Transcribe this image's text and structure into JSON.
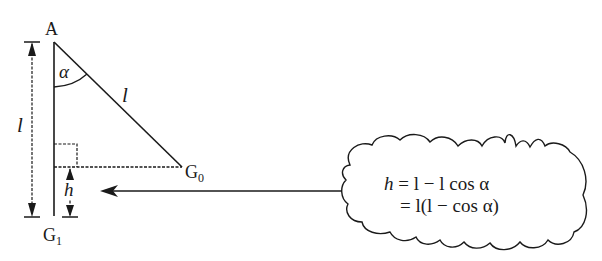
{
  "diagram": {
    "type": "pendulum-geometry",
    "colors": {
      "stroke": "#1a1a1a",
      "background": "#ffffff"
    },
    "labels": {
      "pivot": "A",
      "angle": "α",
      "string_length": "l",
      "vertical_length": "l",
      "start_point_main": "G",
      "start_point_sub": "0",
      "end_point_main": "G",
      "end_point_sub": "1",
      "height": "h"
    },
    "callout": {
      "line1_lhs": "h",
      "line1_rhs": "= l − l cos α",
      "line2": "= l(l − cos α)"
    }
  }
}
